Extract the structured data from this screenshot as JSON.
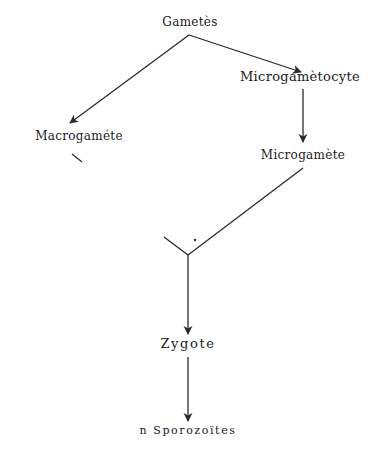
{
  "diagram": {
    "type": "life-cycle flow",
    "nodes": [
      {
        "id": "gametes",
        "label": "Gametès",
        "x": 190,
        "y": 22
      },
      {
        "id": "macrogamete",
        "label": "Macrogaméte",
        "x": 79,
        "y": 136
      },
      {
        "id": "microgametocyte",
        "label": "Microgamètocyte",
        "x": 300,
        "y": 76
      },
      {
        "id": "microgamete",
        "label": "Microgamète",
        "x": 303,
        "y": 155
      },
      {
        "id": "zygote",
        "label": "Zygote",
        "x": 188,
        "y": 343
      },
      {
        "id": "sporozoites",
        "label": "n Sporozoïtes",
        "x": 188,
        "y": 430
      }
    ],
    "edges": [
      {
        "from": "gametes",
        "to": "macrogamete",
        "arrow": true
      },
      {
        "from": "gametes",
        "to": "microgametocyte",
        "arrow": true
      },
      {
        "from": "microgametocyte",
        "to": "microgamete",
        "arrow": true
      },
      {
        "from": "microgamete",
        "to": "fusion-point",
        "arrow": false
      },
      {
        "from": "macrogamete",
        "to": "fusion-point",
        "arrow": false,
        "note": "partial stroke"
      },
      {
        "from": "fusion-point",
        "to": "zygote",
        "arrow": true
      },
      {
        "from": "zygote",
        "to": "sporozoites",
        "arrow": true
      }
    ],
    "colors": {
      "line": "#2a2a2a",
      "text": "#1a1a1a",
      "background": "#ffffff"
    }
  }
}
